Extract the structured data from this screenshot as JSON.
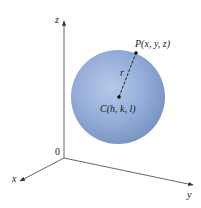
{
  "diagram": {
    "type": "sphere-in-3d-coordinates",
    "axes": {
      "x_label": "x",
      "y_label": "y",
      "z_label": "z",
      "origin_label": "0"
    },
    "sphere": {
      "fill_color": "#8fa9d6",
      "highlight_color": "#b7c9e8",
      "shadow_color": "#7a94c4"
    },
    "points": {
      "P": {
        "label": "P(x, y, z)"
      },
      "C": {
        "label": "C(h, k, l)"
      }
    },
    "radius_label": "r",
    "line_color": "#333333"
  }
}
